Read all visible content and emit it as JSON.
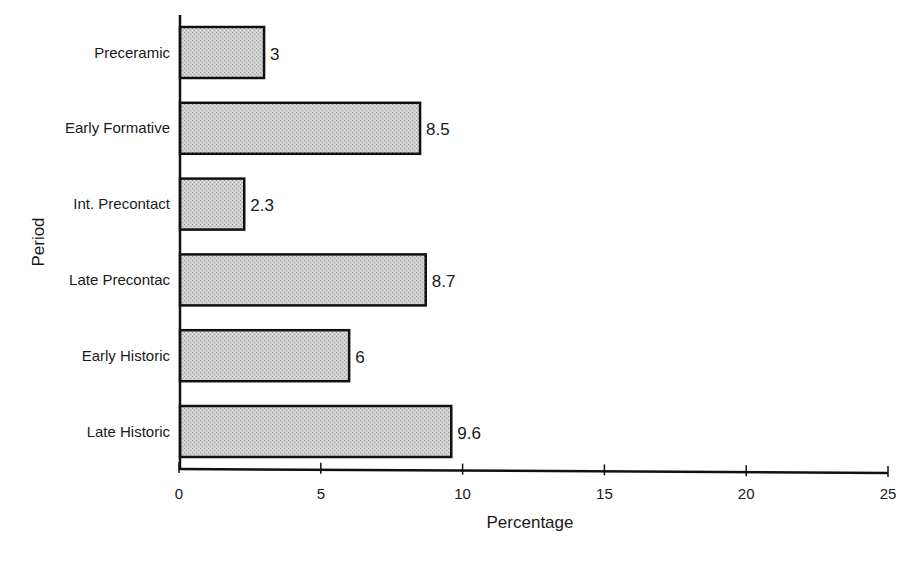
{
  "chart_data": {
    "type": "bar",
    "orientation": "horizontal",
    "title": "",
    "xlabel": "Percentage",
    "ylabel": "Period",
    "xlim": [
      0,
      25
    ],
    "xticks": [
      0,
      5,
      10,
      15,
      20,
      25
    ],
    "grid": false,
    "legend": null,
    "categories": [
      "Preceramic",
      "Early Formative",
      "Int. Precontact",
      "Late Precontac",
      "Early Historic",
      "Late Historic"
    ],
    "values": [
      3,
      8.5,
      2.3,
      8.7,
      6,
      9.6
    ],
    "value_labels": [
      "3",
      "8.5",
      "2.3",
      "8.7",
      "6",
      "9.6"
    ],
    "bar_fill": "#c8c8c8",
    "bar_stroke": "#111111"
  }
}
